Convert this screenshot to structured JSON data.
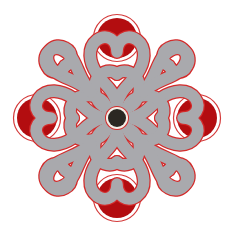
{
  "figure": {
    "description": "Celtic-style four-fold knot ornament with red lobes and grey interlaced bands",
    "symmetry": "4-fold rotational",
    "center": {
      "x": 117,
      "y": 118
    }
  },
  "colors": {
    "background": "#ffffff",
    "band_fill": "#a9a9ad",
    "band_outline": "#d42a2a",
    "lobe_fill": "#b30d10",
    "lobe_ring": "#d43a3a",
    "center_fill": "#2b2722",
    "center_ring": "#f4efe8"
  },
  "lobes": [
    "north",
    "east",
    "south",
    "west"
  ]
}
